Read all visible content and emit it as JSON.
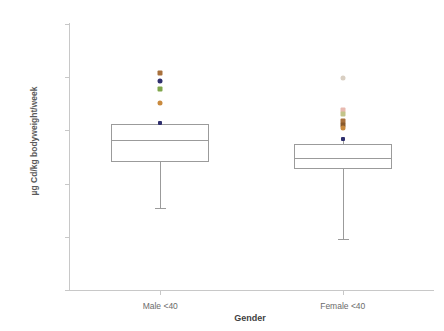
{
  "chart_data": {
    "type": "box",
    "title": "",
    "xlabel": "Gender",
    "ylabel": "µg Cd/kg bodyweight/week",
    "y_scale": "log",
    "ylim": [
      0.01,
      1000.0
    ],
    "grid": false,
    "legend": "none",
    "y_ticks": [
      {
        "value": 1000.0,
        "label": "1000.00"
      },
      {
        "value": 100.0,
        "label": "100.00"
      },
      {
        "value": 10.0,
        "label": "10.00"
      },
      {
        "value": 1.0,
        "label": "1.00"
      },
      {
        "value": 0.1,
        "label": "0.10"
      },
      {
        "value": 0.01,
        "label": "0.01"
      }
    ],
    "categories": [
      "Male <40",
      "Female <40"
    ],
    "boxes": [
      {
        "name": "Male <40",
        "whisker_low": 0.35,
        "q1": 2.5,
        "median": 6.5,
        "q3": 13.0,
        "whisker_high": 14.0,
        "outliers": [
          {
            "value": 120.0,
            "color": "#a8703c",
            "shape": "square"
          },
          {
            "value": 85.0,
            "color": "#2f2f6e",
            "shape": "circle"
          },
          {
            "value": 60.0,
            "color": "#7fa64b",
            "shape": "square"
          },
          {
            "value": 33.0,
            "color": "#c98a3e",
            "shape": "circle"
          }
        ]
      },
      {
        "name": "Female <40",
        "whisker_low": 0.09,
        "q1": 1.9,
        "median": 3.0,
        "q3": 5.5,
        "whisker_high": 7.0,
        "outliers": [
          {
            "value": 95.0,
            "color": "#d9cfc2",
            "shape": "circle"
          },
          {
            "value": 24.0,
            "color": "#e8b9b0",
            "shape": "square"
          },
          {
            "value": 20.0,
            "color": "#c3c48a",
            "shape": "square"
          },
          {
            "value": 15.0,
            "color": "#a8703c",
            "shape": "square"
          },
          {
            "value": 12.5,
            "color": "#8a5a2b",
            "shape": "square"
          },
          {
            "value": 11.0,
            "color": "#c98a3e",
            "shape": "circle"
          }
        ]
      }
    ]
  },
  "colors": {
    "axis": "#c8c8c8",
    "box_stroke": "#9b9b9b",
    "tick_text": "#6b6b6b",
    "title_text": "#3f3f3f",
    "background": "#ffffff"
  }
}
